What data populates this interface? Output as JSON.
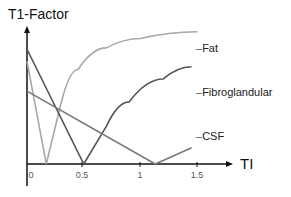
{
  "chart_data": {
    "type": "line",
    "title": "",
    "ylabel": "T1-Factor",
    "xlabel": "TI",
    "x_ticks": [
      "0",
      "0.5",
      "1",
      "1.5"
    ],
    "xlim": [
      0,
      1.8
    ],
    "ylim": [
      0,
      1
    ],
    "grid": false,
    "legend_position": "right",
    "series": [
      {
        "name": "Fat",
        "color": "#a8a8a8",
        "points": [
          [
            0,
            0.76
          ],
          [
            0.17,
            0
          ],
          [
            0.3,
            0.45
          ],
          [
            0.45,
            0.7
          ],
          [
            0.7,
            0.86
          ],
          [
            1.0,
            0.93
          ],
          [
            1.5,
            0.98
          ]
        ]
      },
      {
        "name": "Fibroglandular",
        "color": "#555555",
        "points": [
          [
            0,
            0.85
          ],
          [
            0.5,
            0
          ],
          [
            0.7,
            0.28
          ],
          [
            0.9,
            0.46
          ],
          [
            1.2,
            0.63
          ],
          [
            1.45,
            0.72
          ]
        ]
      },
      {
        "name": "CSF",
        "color": "#7a7a7a",
        "points": [
          [
            0,
            0.54
          ],
          [
            1.13,
            0
          ],
          [
            1.45,
            0.12
          ]
        ]
      }
    ]
  }
}
